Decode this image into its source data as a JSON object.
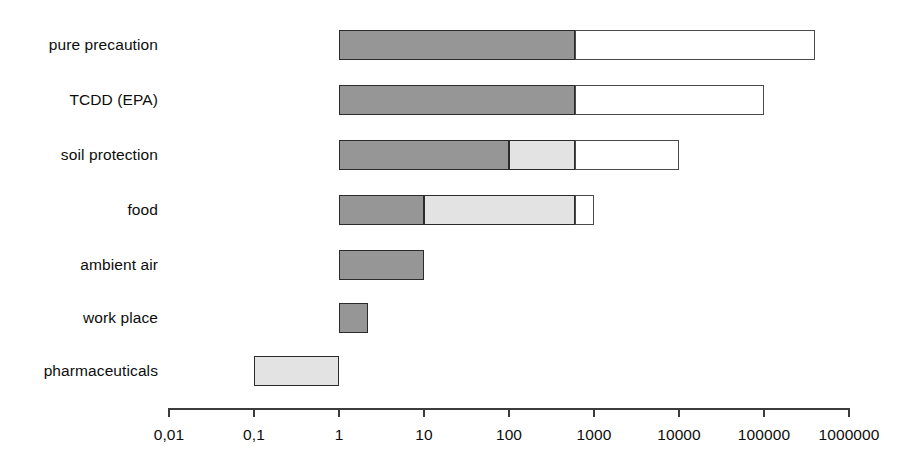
{
  "chart_data": {
    "type": "bar",
    "orientation": "horizontal",
    "title": "",
    "subtitle": "",
    "xlabel": "",
    "ylabel": "",
    "xscale": "log",
    "xlim": [
      0.01,
      1000000
    ],
    "grid": false,
    "legend": null,
    "xticks": [
      {
        "value": 0.01,
        "label": "0,01"
      },
      {
        "value": 0.1,
        "label": "0,1"
      },
      {
        "value": 1,
        "label": "1"
      },
      {
        "value": 10,
        "label": "10"
      },
      {
        "value": 100,
        "label": "100"
      },
      {
        "value": 1000,
        "label": "1000"
      },
      {
        "value": 10000,
        "label": "10000"
      },
      {
        "value": 100000,
        "label": "100000"
      },
      {
        "value": 1000000,
        "label": "1000000"
      }
    ],
    "categories": [
      "pure precaution",
      "TCDD (EPA)",
      "soil protection",
      "food",
      "ambient air",
      "work place",
      "pharmaceuticals"
    ],
    "colors": {
      "dark": "#969696",
      "light": "#e3e3e3",
      "white": "#ffffff",
      "outline": "#2b2b2b",
      "axis": "#3c3c3c",
      "text": "#0d0d0d"
    },
    "bars": [
      {
        "category": "pure precaution",
        "start": 1,
        "end": 400000,
        "segments": [
          {
            "from": 1,
            "to": 600,
            "fill": "dark"
          },
          {
            "from": 600,
            "to": 400000,
            "fill": "white"
          }
        ]
      },
      {
        "category": "TCDD (EPA)",
        "start": 1,
        "end": 100000,
        "segments": [
          {
            "from": 1,
            "to": 600,
            "fill": "dark"
          },
          {
            "from": 600,
            "to": 100000,
            "fill": "white"
          }
        ]
      },
      {
        "category": "soil protection",
        "start": 1,
        "end": 10000,
        "segments": [
          {
            "from": 1,
            "to": 100,
            "fill": "dark"
          },
          {
            "from": 100,
            "to": 600,
            "fill": "light"
          },
          {
            "from": 600,
            "to": 10000,
            "fill": "white"
          }
        ]
      },
      {
        "category": "food",
        "start": 1,
        "end": 1000,
        "segments": [
          {
            "from": 1,
            "to": 10,
            "fill": "dark"
          },
          {
            "from": 10,
            "to": 600,
            "fill": "light"
          },
          {
            "from": 600,
            "to": 1000,
            "fill": "white"
          }
        ]
      },
      {
        "category": "ambient air",
        "start": 1,
        "end": 10,
        "segments": [
          {
            "from": 1,
            "to": 10,
            "fill": "dark"
          }
        ]
      },
      {
        "category": "work place",
        "start": 1,
        "end": 2.2,
        "segments": [
          {
            "from": 1,
            "to": 2.2,
            "fill": "dark"
          }
        ]
      },
      {
        "category": "pharmaceuticals",
        "start": 0.1,
        "end": 1,
        "segments": [
          {
            "from": 0.1,
            "to": 1,
            "fill": "light"
          }
        ]
      }
    ]
  },
  "geometry": {
    "axis_x0_px": 169,
    "axis_x1_px": 849,
    "axis_y_px": 408,
    "decade_px": 85,
    "row_tops_px": [
      30,
      85,
      140,
      195,
      250,
      303,
      356
    ],
    "row_height_px": 30,
    "label_baselines_px": [
      40,
      95,
      150,
      205,
      260,
      313,
      366
    ]
  }
}
